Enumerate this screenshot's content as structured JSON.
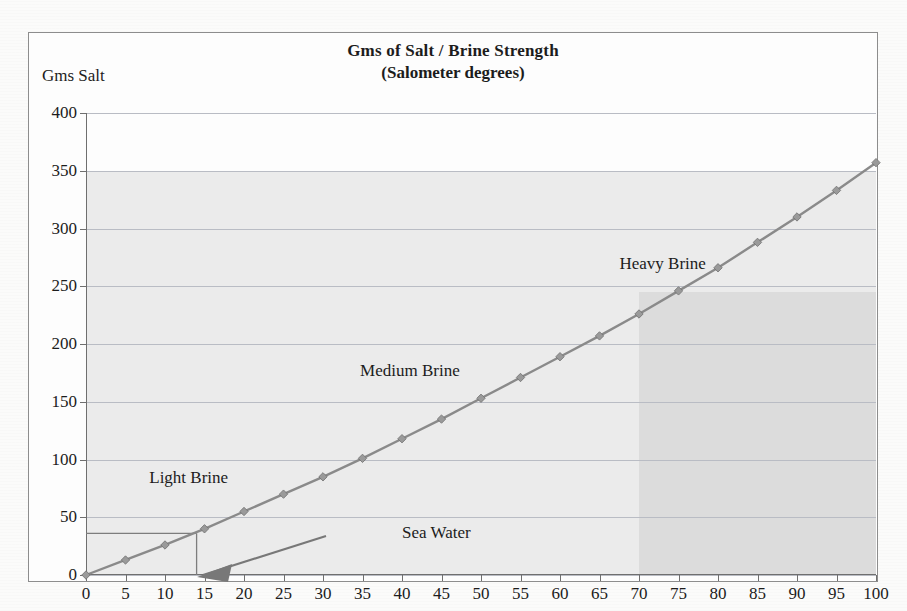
{
  "chart_data": {
    "type": "line",
    "title": "Gms of Salt / Brine Strength",
    "subtitle": "(Salometer degrees)",
    "xlabel": "",
    "ylabel": "Gms Salt",
    "xlim": [
      0,
      100
    ],
    "ylim": [
      0,
      400
    ],
    "grid": true,
    "legend": "none",
    "x_ticks": [
      0,
      5,
      10,
      15,
      20,
      25,
      30,
      35,
      40,
      45,
      50,
      55,
      60,
      65,
      70,
      75,
      80,
      85,
      90,
      95,
      100
    ],
    "y_ticks": [
      0,
      50,
      100,
      150,
      200,
      250,
      300,
      350,
      400
    ],
    "series": [
      {
        "name": "Gms Salt",
        "marker": "diamond",
        "color": "#8a8a8a",
        "x": [
          0,
          5,
          10,
          15,
          20,
          25,
          30,
          35,
          40,
          45,
          50,
          55,
          60,
          65,
          70,
          75,
          80,
          85,
          90,
          95,
          100
        ],
        "values": [
          0,
          13,
          26,
          40,
          55,
          70,
          85,
          101,
          118,
          135,
          153,
          171,
          189,
          207,
          226,
          246,
          266,
          288,
          310,
          333,
          357
        ]
      }
    ],
    "annotations": [
      {
        "name": "light-brine",
        "text": "Light Brine",
        "x": 13,
        "y": 84
      },
      {
        "name": "medium-brine",
        "text": "Medium Brine",
        "x": 41,
        "y": 177
      },
      {
        "name": "heavy-brine",
        "text": "Heavy Brine",
        "x": 73,
        "y": 269
      },
      {
        "name": "sea-water",
        "text": "Sea Water",
        "x": 40,
        "y": 36
      }
    ],
    "reference_lines": [
      {
        "name": "sea-water-salt-level",
        "orientation": "horizontal",
        "y": 36,
        "x_from": 0,
        "x_to": 14
      },
      {
        "name": "sea-water-strength",
        "orientation": "vertical",
        "x": 14,
        "y_from": 0,
        "y_to": 36
      }
    ],
    "shaded_bands": [
      {
        "name": "scan-shade-upper",
        "y_from": 0,
        "y_to": 350,
        "x_from": 0,
        "x_to": 100
      },
      {
        "name": "scan-shade-heavy-zone",
        "y_from": 0,
        "y_to": 245,
        "x_from": 70,
        "x_to": 100
      }
    ]
  }
}
